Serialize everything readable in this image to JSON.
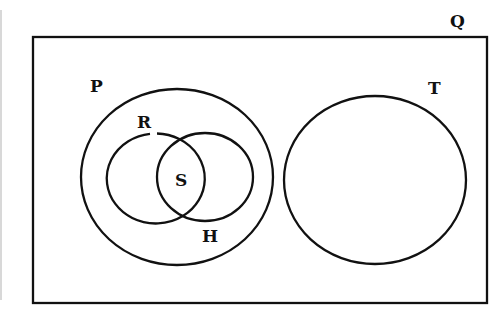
{
  "diagram": {
    "type": "venn",
    "universal_set": {
      "label": "Q"
    },
    "sets": [
      {
        "label": "P",
        "contains": [
          "R",
          "H"
        ]
      },
      {
        "label": "R",
        "within": "P"
      },
      {
        "label": "H",
        "within": "P"
      },
      {
        "label": "T",
        "disjoint_from": "P"
      }
    ],
    "regions": [
      {
        "label": "S",
        "description": "intersection of R and H"
      }
    ],
    "colors": {
      "stroke": "#111111",
      "background": "#ffffff"
    }
  }
}
